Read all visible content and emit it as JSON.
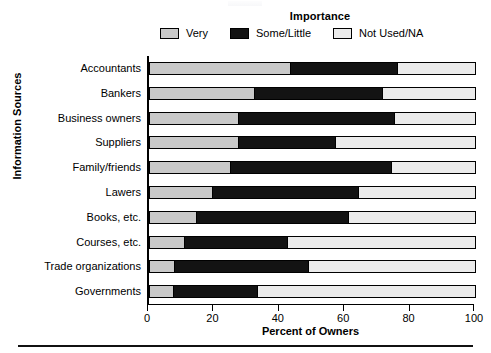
{
  "chart_data": {
    "type": "bar",
    "orientation": "horizontal",
    "stacked": true,
    "title": "",
    "xlabel": "Percent of Owners",
    "ylabel": "Information Sources",
    "xlim": [
      0,
      100
    ],
    "xticks": [
      0,
      20,
      40,
      60,
      80,
      100
    ],
    "xticklabels": [
      "0",
      "20",
      "40",
      "60",
      "80",
      "100"
    ],
    "grid": false,
    "legend_title": "Importance",
    "legend_position": "top",
    "categories": [
      "Accountants",
      "Bankers",
      "Business owners",
      "Suppliers",
      "Family/friends",
      "Lawers",
      "Books, etc.",
      "Courses, etc.",
      "Trade organizations",
      "Governments"
    ],
    "series": [
      {
        "name": "Very",
        "color": "#c9c9c9",
        "values": [
          43,
          32,
          27,
          27,
          24.5,
          19,
          14,
          10.5,
          7.5,
          7
        ]
      },
      {
        "name": "Some/Little",
        "color": "#131313",
        "values": [
          33,
          39.5,
          48,
          30,
          49.5,
          45,
          47,
          31.5,
          41,
          26
        ]
      },
      {
        "name": "Not Used/NA",
        "color": "#ebebeb",
        "values": [
          24,
          28.5,
          25,
          43,
          26,
          36,
          39,
          58,
          51.5,
          67
        ]
      }
    ]
  },
  "legend": {
    "title": "Importance",
    "items": [
      {
        "label": "Very",
        "color": "#c9c9c9"
      },
      {
        "label": "Some/Little",
        "color": "#131313"
      },
      {
        "label": "Not Used/NA",
        "color": "#ebebeb"
      }
    ]
  },
  "axes": {
    "y_title": "Information Sources",
    "x_title": "Percent of Owners"
  }
}
